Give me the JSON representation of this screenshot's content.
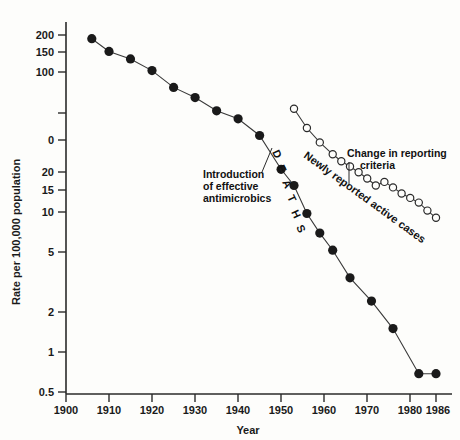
{
  "chart_data": {
    "type": "line",
    "title": "",
    "xlabel": "Year",
    "ylabel": "Rate per 100,000 population",
    "scale": "log-y",
    "grid": false,
    "legend_position": "none",
    "xlim": [
      1900,
      1988
    ],
    "ylim": [
      0.5,
      260
    ],
    "x_ticks": [
      "1900",
      "1910",
      "1920",
      "1930",
      "1940",
      "1950",
      "1960",
      "1970",
      "1980",
      "1986"
    ],
    "x_tick_values": [
      1900,
      1910,
      1920,
      1930,
      1940,
      1950,
      1960,
      1970,
      1980,
      1986
    ],
    "y_ticks": [
      "200",
      "150",
      "100",
      "",
      "0",
      "20",
      "15",
      "10",
      "5",
      "2",
      "1",
      "0.5"
    ],
    "y_tick_values": [
      200,
      150,
      100,
      70,
      50,
      20,
      15,
      10,
      5,
      2,
      1,
      0.5
    ],
    "series": [
      {
        "name": "Deaths",
        "marker": "filled-circle",
        "color": "#1a1a1a",
        "points": [
          {
            "x": 1906,
            "y": 188
          },
          {
            "x": 1910,
            "y": 152
          },
          {
            "x": 1915,
            "y": 134
          },
          {
            "x": 1920,
            "y": 110
          },
          {
            "x": 1925,
            "y": 83
          },
          {
            "x": 1930,
            "y": 70
          },
          {
            "x": 1935,
            "y": 56
          },
          {
            "x": 1940,
            "y": 49
          },
          {
            "x": 1945,
            "y": 37
          },
          {
            "x": 1950,
            "y": 21
          },
          {
            "x": 1953,
            "y": 16
          },
          {
            "x": 1956,
            "y": 10
          },
          {
            "x": 1959,
            "y": 7.2
          },
          {
            "x": 1962,
            "y": 5.4
          },
          {
            "x": 1966,
            "y": 3.4
          },
          {
            "x": 1971,
            "y": 2.3
          },
          {
            "x": 1976,
            "y": 1.45
          },
          {
            "x": 1982,
            "y": 0.68
          },
          {
            "x": 1986,
            "y": 0.68
          }
        ]
      },
      {
        "name": "Newly reported active cases",
        "marker": "open-circle",
        "color": "#1a1a1a",
        "points": [
          {
            "x": 1953,
            "y": 58
          },
          {
            "x": 1956,
            "y": 42
          },
          {
            "x": 1959,
            "y": 33
          },
          {
            "x": 1962,
            "y": 27
          },
          {
            "x": 1964,
            "y": 24
          },
          {
            "x": 1966,
            "y": 22
          },
          {
            "x": 1968,
            "y": 20
          },
          {
            "x": 1970,
            "y": 18
          },
          {
            "x": 1972,
            "y": 16
          },
          {
            "x": 1974,
            "y": 17
          },
          {
            "x": 1976,
            "y": 15.5
          },
          {
            "x": 1978,
            "y": 14
          },
          {
            "x": 1980,
            "y": 13
          },
          {
            "x": 1982,
            "y": 12
          },
          {
            "x": 1984,
            "y": 10.5
          },
          {
            "x": 1986,
            "y": 9.3
          }
        ]
      }
    ],
    "annotations": [
      {
        "name": "introduction-of-effective-antimicrobics",
        "text": "Introduction of effective antimicrobics",
        "lines": [
          "Introduction",
          "of effective",
          "antimicrobics"
        ]
      },
      {
        "name": "deaths-series-label",
        "text": "DEATHS",
        "letters": [
          "D",
          "E",
          "A",
          "T",
          "H",
          "S"
        ]
      },
      {
        "name": "newly-reported-active-cases-label",
        "text": "Newly reported active cases"
      },
      {
        "name": "change-in-reporting-criteria",
        "text": "Change in reporting criteria",
        "lines": [
          "Change in reporting",
          "criteria"
        ]
      }
    ]
  },
  "colors": {
    "ink": "#1a1a1a",
    "line": "#444444",
    "background": "#fdfdfb"
  }
}
